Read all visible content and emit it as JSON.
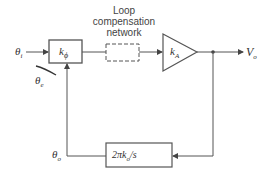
{
  "diagram": {
    "type": "block-diagram",
    "input_label": "θ",
    "input_sub": "i",
    "error_label": "θ",
    "error_sub": "e",
    "output_label": "V",
    "output_sub": "o",
    "feedback_label": "θ",
    "feedback_sub": "o",
    "blocks": {
      "phase_detector": {
        "label": "k",
        "sub": "ϕ"
      },
      "loop_filter": {
        "caption_line1": "Loop",
        "caption_line2": "compensation",
        "caption_line3": "network",
        "style": "dashed"
      },
      "amplifier": {
        "label": "k",
        "sub": "A"
      },
      "vco": {
        "label": "2πk",
        "sub": "o",
        "suffix": "/s"
      }
    },
    "colors": {
      "line": "#555555",
      "text": "#333333",
      "background": "#ffffff"
    }
  }
}
